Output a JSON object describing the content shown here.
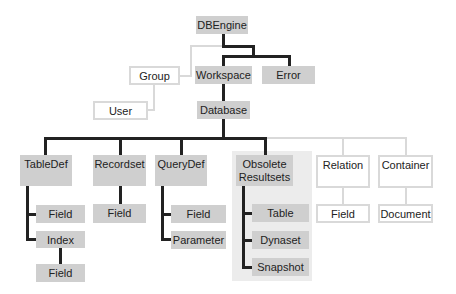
{
  "diagram": {
    "colors": {
      "active_fill": "#cfcfcf",
      "outline_border": "#d9d9d9",
      "connector": "#222222",
      "obsolete_region": "#ececec"
    },
    "nodes": {
      "dbengine": "DBEngine",
      "group": "Group",
      "workspace": "Workspace",
      "error": "Error",
      "user": "User",
      "database": "Database",
      "tabledef": "TableDef",
      "recordset": "Recordset",
      "querydef": "QueryDef",
      "obsolete_line1": "Obsolete",
      "obsolete_line2": "Resultsets",
      "relation": "Relation",
      "container": "Container",
      "tabledef_field": "Field",
      "tabledef_index": "Index",
      "index_field": "Field",
      "recordset_field": "Field",
      "querydef_field": "Field",
      "querydef_parameter": "Parameter",
      "table": "Table",
      "dynaset": "Dynaset",
      "snapshot": "Snapshot",
      "relation_field": "Field",
      "document": "Document"
    }
  }
}
